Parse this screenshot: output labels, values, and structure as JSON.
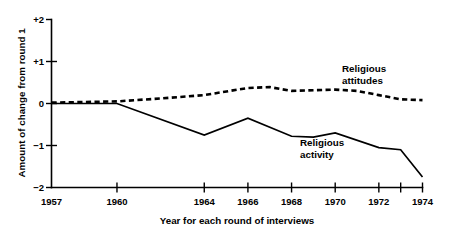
{
  "chart_data": {
    "type": "line",
    "title": "",
    "xlabel": "Year for each round of interviews",
    "ylabel": "Amount of change from round 1",
    "xlim": [
      1957,
      1974
    ],
    "ylim": [
      -2,
      2
    ],
    "grid": false,
    "legend_position": "inline-annotations",
    "xticks": [
      {
        "value": 1957,
        "label": "1957"
      },
      {
        "value": 1960,
        "label": "1960"
      },
      {
        "value": 1964,
        "label": "1964"
      },
      {
        "value": 1966,
        "label": "1966"
      },
      {
        "value": 1968,
        "label": "1968"
      },
      {
        "value": 1970,
        "label": "1970"
      },
      {
        "value": 1972,
        "label": "1972"
      },
      {
        "value": 1973,
        "label": ""
      },
      {
        "value": 1974,
        "label": "1974"
      }
    ],
    "yticks": [
      {
        "value": 2,
        "label": "+2"
      },
      {
        "value": 1,
        "label": "+1"
      },
      {
        "value": 0,
        "label": "0"
      },
      {
        "value": -1,
        "label": "−1"
      },
      {
        "value": -2,
        "label": "−2"
      }
    ],
    "series": [
      {
        "name": "Religious attitudes",
        "style": "dashed",
        "color": "#000000",
        "annotation": "Religious\nattitudes",
        "annotation_line1": "Religious",
        "annotation_line2": "attitudes",
        "x": [
          1957,
          1960,
          1962,
          1964,
          1966,
          1967,
          1968,
          1970,
          1971,
          1972,
          1973,
          1974
        ],
        "values": [
          0.02,
          0.05,
          0.12,
          0.2,
          0.37,
          0.39,
          0.3,
          0.33,
          0.3,
          0.2,
          0.1,
          0.08
        ]
      },
      {
        "name": "Religious activity",
        "style": "solid",
        "color": "#000000",
        "annotation": "Religious\nactivity",
        "annotation_line1": "Religious",
        "annotation_line2": "activity",
        "x": [
          1957,
          1960,
          1964,
          1966,
          1968,
          1969,
          1970,
          1972,
          1973,
          1974
        ],
        "values": [
          0.0,
          0.0,
          -0.75,
          -0.35,
          -0.78,
          -0.8,
          -0.7,
          -1.05,
          -1.1,
          -1.75
        ]
      }
    ]
  },
  "axis": {
    "y_title": "Amount of change from round 1",
    "x_title": "Year for each round of interviews"
  }
}
